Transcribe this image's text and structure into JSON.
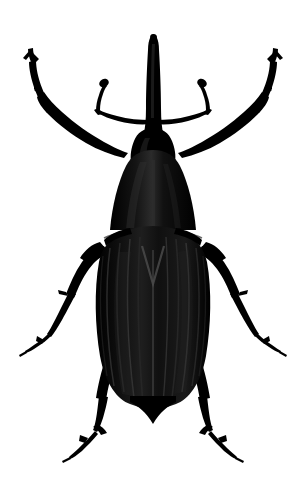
{
  "image": {
    "subject": "weevil-beetle-specimen",
    "common_name": "Weevil",
    "view": "dorsal",
    "style": "high-contrast black silhouette on white",
    "width": 306,
    "height": 495,
    "background_color": "#ffffff",
    "body_color": "#000000",
    "highlight_color": "#2a2a2a",
    "stria_color": "#1c1c1c",
    "caption": ""
  },
  "anatomy": {
    "rostrum": {
      "label": "Rostrum (snout)",
      "tip_y": 36,
      "base_y": 140,
      "center_x": 154
    },
    "head": {
      "label": "Head capsule",
      "top_y": 128,
      "bottom_y": 160
    },
    "pronotum": {
      "label": "Pronotum",
      "top_y": 152,
      "bottom_y": 232,
      "max_width": 86
    },
    "elytra": {
      "label": "Elytra",
      "top_y": 228,
      "apex_y": 410,
      "max_width": 104,
      "stria_count": 10,
      "scutellum_mark": "V-shaped"
    },
    "antennae": {
      "label": "Geniculate antennae",
      "count": 2,
      "club_shape": "oval",
      "attachment_y": 116
    },
    "legs": {
      "label": "Legs",
      "count": 6,
      "pairs": [
        {
          "name": "fore-leg",
          "direction": "up-and-out"
        },
        {
          "name": "mid-leg",
          "direction": "down-and-out"
        },
        {
          "name": "hind-leg",
          "direction": "down-and-out-steep"
        }
      ]
    }
  },
  "colors": {
    "background": "#ffffff",
    "silhouette": "#000000",
    "sheen": "#333333",
    "outline": "#0a0a0a"
  }
}
